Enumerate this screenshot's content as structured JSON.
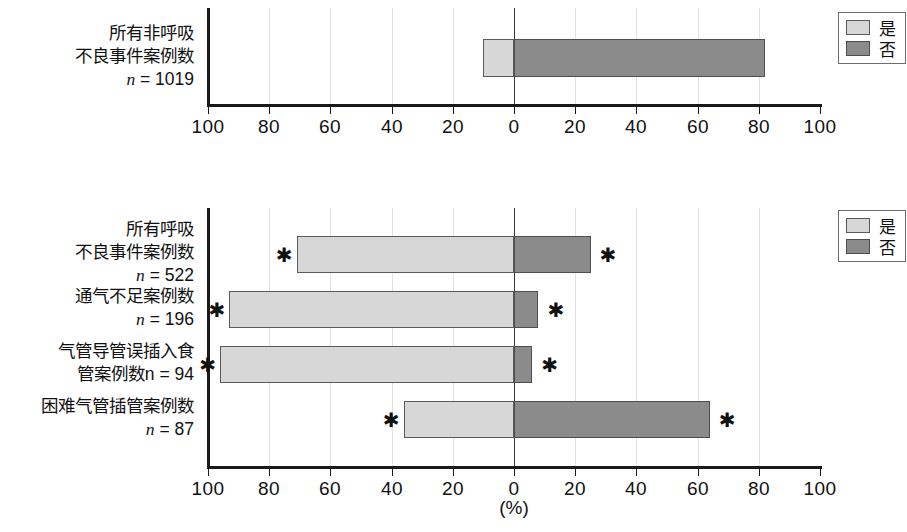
{
  "chart_data": {
    "type": "bar",
    "title": "",
    "xlabel": "(%)",
    "ylabel": "",
    "orientation": "horizontal-diverging",
    "xlim": [
      -100,
      100
    ],
    "xticks": [
      -100,
      -80,
      -60,
      -40,
      -20,
      0,
      20,
      40,
      60,
      80,
      100
    ],
    "xticklabels": [
      "100",
      "80",
      "60",
      "40",
      "20",
      "0",
      "20",
      "40",
      "60",
      "80",
      "100"
    ],
    "grid": true,
    "legend": {
      "position": "right",
      "entries": [
        {
          "label": "是",
          "color": "#d7d7d7",
          "key": "yes"
        },
        {
          "label": "否",
          "color": "#8b8b8b",
          "key": "no"
        }
      ]
    },
    "panels": [
      {
        "id": "panel-top",
        "categories": [
          {
            "lines": [
              "所有非呼吸",
              "不良事件案例数"
            ],
            "n_label": "n = 1019",
            "n_prefix": "n",
            "n_value": "1019",
            "yes": 10,
            "no": 82,
            "significant_left": false,
            "significant_right": false
          }
        ]
      },
      {
        "id": "panel-bottom",
        "categories": [
          {
            "lines": [
              "所有呼吸",
              "不良事件案例数"
            ],
            "n_label": "n = 522",
            "n_prefix": "n",
            "n_value": "522",
            "yes": 71,
            "no": 25,
            "significant_left": true,
            "significant_right": true
          },
          {
            "lines": [
              "通气不足案例数"
            ],
            "n_label": "n = 196",
            "n_prefix": "n",
            "n_value": "196",
            "yes": 93,
            "no": 8,
            "significant_left": true,
            "significant_right": true
          },
          {
            "lines": [
              "气管导管误插入食",
              "管案例数n = 94"
            ],
            "n_label": "",
            "n_prefix": "n",
            "n_value": "94",
            "yes": 96,
            "no": 6,
            "significant_left": true,
            "significant_right": true
          },
          {
            "lines": [
              "困难气管插管案例数"
            ],
            "n_label": "n = 87",
            "n_prefix": "n",
            "n_value": "87",
            "yes": 36,
            "no": 64,
            "significant_left": true,
            "significant_right": true
          }
        ]
      }
    ],
    "star_marker": "✱",
    "colors": {
      "yes_fill": "#d7d7d7",
      "no_fill": "#8b8b8b",
      "axis": "#1a1a1a",
      "grid": "#e2e2e2",
      "bar_stroke": "#5a5a5a"
    }
  }
}
